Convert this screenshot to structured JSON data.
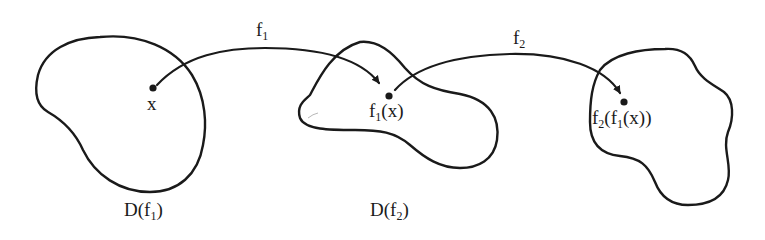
{
  "diagram": {
    "type": "function composition domain mapping",
    "domains": [
      {
        "id": "D1",
        "label_main": "D(f",
        "label_sub": "1",
        "label_close": ")"
      },
      {
        "id": "D2",
        "label_main": "D(f",
        "label_sub": "2",
        "label_close": ")"
      },
      {
        "id": "D3",
        "label_main": "",
        "label_sub": "",
        "label_close": ""
      }
    ],
    "points": [
      {
        "id": "x",
        "label": "x"
      },
      {
        "id": "f1x",
        "label_a": "f",
        "label_sub": "1",
        "label_b": "(x)"
      },
      {
        "id": "f2f1x",
        "label_a": "f",
        "label_sub1": "2",
        "label_b": "(f",
        "label_sub2": "1",
        "label_c": "(x))"
      }
    ],
    "arrows": [
      {
        "id": "f1",
        "label_main": "f",
        "label_sub": "1",
        "from": "x",
        "to": "f1x"
      },
      {
        "id": "f2",
        "label_main": "f",
        "label_sub": "2",
        "from": "f1x",
        "to": "f2f1x"
      }
    ],
    "colors": {
      "stroke": "#1a1a1a",
      "background": "#ffffff"
    }
  }
}
